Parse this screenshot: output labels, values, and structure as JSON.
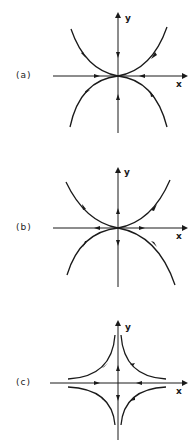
{
  "figure": {
    "panels": [
      {
        "label": "(a)",
        "x_axis_label": "x",
        "y_axis_label": "y",
        "flow": "all trajectories directed toward origin (stable degenerate node)"
      },
      {
        "label": "(b)",
        "x_axis_label": "x",
        "y_axis_label": "y",
        "flow": "all trajectories directed away from origin (unstable degenerate node)"
      },
      {
        "label": "(c)",
        "x_axis_label": "x",
        "y_axis_label": "y",
        "flow": "inflow along x-axis toward origin, outflow along y-axis (saddle)"
      }
    ],
    "colors": {
      "stroke": "#1a1a1a",
      "background": "#ffffff"
    }
  }
}
